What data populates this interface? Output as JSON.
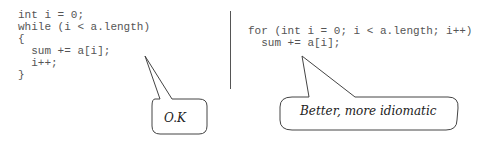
{
  "left_panel": {
    "code_lines": [
      "int i = 0;",
      "while (i < a.length)",
      "{",
      "  sum += a[i];",
      "  i++;",
      "}"
    ],
    "callout": "O.K"
  },
  "right_panel": {
    "code_lines": [
      "for (int i = 0; i < a.length; i++)",
      "  sum += a[i];"
    ],
    "callout": "Better, more idiomatic"
  }
}
